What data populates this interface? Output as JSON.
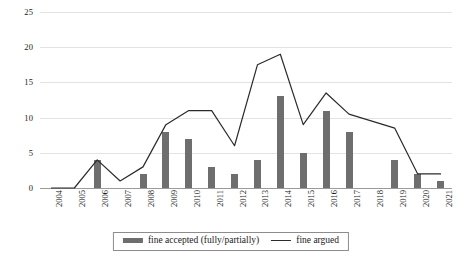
{
  "chart_data": {
    "type": "bar",
    "title": "",
    "xlabel": "",
    "ylabel": "",
    "ylim": [
      0,
      25
    ],
    "yticks": [
      0,
      5,
      10,
      15,
      20,
      25
    ],
    "grid": true,
    "legend_position": "bottom",
    "categories": [
      "2004",
      "2005",
      "2006",
      "2007",
      "2008",
      "2009",
      "2010",
      "2011",
      "2012",
      "2013",
      "2014",
      "2015",
      "2016",
      "2017",
      "2018",
      "2019",
      "2020",
      "2021"
    ],
    "series": [
      {
        "name": "fine accepted (fully/partially)",
        "type": "bar",
        "color": "#6e6e6e",
        "values": [
          0,
          0,
          4,
          0,
          2,
          8,
          7,
          3,
          2,
          4,
          13,
          5,
          11,
          8,
          0,
          4,
          2,
          1
        ]
      },
      {
        "name": "fine argued",
        "type": "line",
        "color": "#2b2b2b",
        "values": [
          0,
          0,
          4,
          1,
          3,
          9,
          11,
          11,
          6,
          17.5,
          19,
          9,
          13.5,
          10.5,
          9.5,
          8.5,
          2,
          2
        ]
      }
    ]
  },
  "legend": {
    "bar_label": "fine accepted (fully/partially)",
    "line_label": "fine argued"
  },
  "colors": {
    "bar": "#6e6e6e",
    "line": "#2b2b2b",
    "gridline": "#e3e3e3",
    "axis": "#9a9a9a",
    "background": "#ffffff",
    "text": "#1a1a1a"
  }
}
